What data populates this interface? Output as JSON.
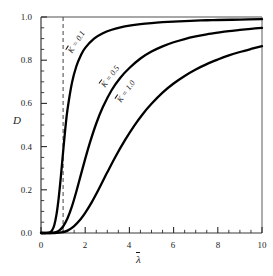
{
  "chart_data": {
    "type": "line",
    "title": "",
    "xlabel": "λ̄",
    "ylabel": "D",
    "xlim": [
      0,
      10
    ],
    "ylim": [
      0,
      1.0
    ],
    "grid": false,
    "legend": "inline-curve-labels",
    "xticks": [
      "0",
      "2",
      "4",
      "6",
      "8",
      "10"
    ],
    "xtick_values": [
      0,
      2,
      4,
      6,
      8,
      10
    ],
    "x_minor_tick_step": 0.5,
    "yticks": [
      "0.0",
      "0.2",
      "0.4",
      "0.6",
      "0.8",
      "1.0"
    ],
    "ytick_values": [
      0.0,
      0.2,
      0.4,
      0.6,
      0.8,
      1.0
    ],
    "y_minor_tick_step": 0.05,
    "annotations": [
      {
        "name": "reference-line",
        "kind": "vertical-dashed-line",
        "x": 1.0,
        "color": "#555555"
      }
    ],
    "series": [
      {
        "name": "K̄ = 0.1",
        "label_prefix": "K",
        "label_suffix": " = 0.1",
        "color": "#000000",
        "x": [
          0,
          0.2,
          0.4,
          0.5,
          0.6,
          0.7,
          0.8,
          0.9,
          1.0,
          1.1,
          1.2,
          1.4,
          1.6,
          1.8,
          2.0,
          2.4,
          2.8,
          3.2,
          3.6,
          4.0,
          4.5,
          5.0,
          5.5,
          6.0,
          6.5,
          7.0,
          7.5,
          8.0,
          9.0,
          10.0
        ],
        "y": [
          0.0,
          0.0,
          0.003,
          0.012,
          0.036,
          0.085,
          0.162,
          0.262,
          0.375,
          0.483,
          0.572,
          0.695,
          0.772,
          0.822,
          0.857,
          0.9,
          0.925,
          0.941,
          0.952,
          0.96,
          0.967,
          0.972,
          0.976,
          0.979,
          0.981,
          0.983,
          0.985,
          0.986,
          0.988,
          0.99
        ]
      },
      {
        "name": "K̄ = 0.5",
        "label_prefix": "K",
        "label_suffix": " = 0.5",
        "color": "#000000",
        "x": [
          0,
          0.4,
          0.6,
          0.8,
          1.0,
          1.2,
          1.4,
          1.6,
          1.8,
          2.0,
          2.2,
          2.5,
          2.8,
          3.2,
          3.6,
          4.0,
          4.5,
          5.0,
          5.5,
          6.0,
          6.5,
          7.0,
          7.5,
          8.0,
          8.5,
          9.0,
          9.5,
          10.0
        ],
        "y": [
          0.0,
          0.0,
          0.002,
          0.01,
          0.03,
          0.068,
          0.123,
          0.192,
          0.268,
          0.343,
          0.414,
          0.507,
          0.583,
          0.662,
          0.72,
          0.764,
          0.808,
          0.84,
          0.864,
          0.883,
          0.898,
          0.91,
          0.92,
          0.928,
          0.935,
          0.94,
          0.945,
          0.95
        ]
      },
      {
        "name": "K̄ = 1.0",
        "label_prefix": "K",
        "label_suffix": " = 1.0",
        "color": "#000000",
        "x": [
          0,
          0.6,
          1.0,
          1.2,
          1.5,
          1.8,
          2.0,
          2.3,
          2.6,
          3.0,
          3.4,
          3.8,
          4.2,
          4.6,
          5.0,
          5.5,
          6.0,
          6.5,
          7.0,
          7.5,
          8.0,
          8.5,
          9.0,
          9.5,
          10.0
        ],
        "y": [
          0.0,
          0.0,
          0.004,
          0.011,
          0.032,
          0.065,
          0.093,
          0.143,
          0.2,
          0.281,
          0.359,
          0.43,
          0.494,
          0.55,
          0.598,
          0.65,
          0.692,
          0.727,
          0.757,
          0.782,
          0.803,
          0.822,
          0.838,
          0.852,
          0.865
        ]
      }
    ],
    "curve_label_placements": [
      {
        "series": 0,
        "x_px": 70,
        "y_px": 48,
        "rotation": -58
      },
      {
        "series": 1,
        "x_px": 103,
        "y_px": 82,
        "rotation": -54
      },
      {
        "series": 2,
        "x_px": 119,
        "y_px": 97,
        "rotation": -55
      }
    ]
  },
  "axes": {
    "x_title": "λ",
    "y_title": "D"
  }
}
